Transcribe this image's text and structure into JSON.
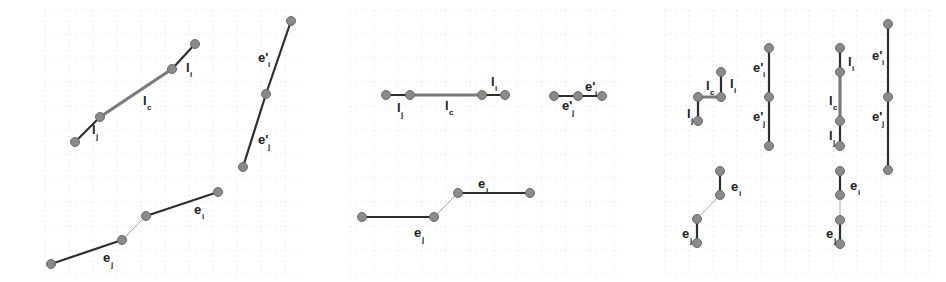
{
  "colors": {
    "edge": "#2e2e2e",
    "common_edge": "#7a7a7a",
    "connector": "#a8a8a8",
    "node_fill": "#8a8a8a",
    "node_stroke": "#6a6a6a",
    "grid": "#ececec"
  },
  "panels": [
    {
      "id": "panel-1-top-left",
      "nodes": [
        [
          75,
          142
        ],
        [
          100,
          117
        ],
        [
          172,
          69
        ],
        [
          195,
          44
        ]
      ],
      "edges": [
        {
          "from": 0,
          "to": 1,
          "kind": "edge"
        },
        {
          "from": 1,
          "to": 2,
          "kind": "common"
        },
        {
          "from": 2,
          "to": 3,
          "kind": "edge"
        }
      ],
      "labels": [
        {
          "base": "l",
          "sub": "j",
          "prime": false,
          "x": 92,
          "y": 134
        },
        {
          "base": "l",
          "sub": "c",
          "prime": false,
          "x": 143,
          "y": 105
        },
        {
          "base": "l",
          "sub": "i",
          "prime": false,
          "x": 186,
          "y": 72
        }
      ]
    },
    {
      "id": "panel-1-top-right",
      "nodes": [
        [
          291,
          21
        ],
        [
          266,
          94
        ],
        [
          243,
          167
        ]
      ],
      "edges": [
        {
          "from": 0,
          "to": 1,
          "kind": "edge"
        },
        {
          "from": 1,
          "to": 2,
          "kind": "edge"
        }
      ],
      "labels": [
        {
          "base": "e",
          "sub": "i",
          "prime": true,
          "x": 258,
          "y": 62
        },
        {
          "base": "e",
          "sub": "j",
          "prime": true,
          "x": 258,
          "y": 144
        }
      ]
    },
    {
      "id": "panel-1-bottom",
      "nodes": [
        [
          51,
          264
        ],
        [
          122,
          240
        ],
        [
          146,
          216
        ],
        [
          218,
          192
        ]
      ],
      "edges": [
        {
          "from": 0,
          "to": 1,
          "kind": "edge"
        },
        {
          "from": 1,
          "to": 2,
          "kind": "connector"
        },
        {
          "from": 2,
          "to": 3,
          "kind": "edge"
        }
      ],
      "labels": [
        {
          "base": "e",
          "sub": "j",
          "prime": false,
          "x": 103,
          "y": 262
        },
        {
          "base": "e",
          "sub": "i",
          "prime": false,
          "x": 194,
          "y": 214
        }
      ]
    },
    {
      "id": "panel-2-top-left",
      "nodes": [
        [
          386,
          95
        ],
        [
          410,
          95
        ],
        [
          482,
          95
        ],
        [
          505,
          95
        ]
      ],
      "edges": [
        {
          "from": 0,
          "to": 1,
          "kind": "edge"
        },
        {
          "from": 1,
          "to": 2,
          "kind": "common"
        },
        {
          "from": 2,
          "to": 3,
          "kind": "edge"
        }
      ],
      "labels": [
        {
          "base": "l",
          "sub": "j",
          "prime": false,
          "x": 397,
          "y": 112
        },
        {
          "base": "l",
          "sub": "c",
          "prime": false,
          "x": 445,
          "y": 110
        },
        {
          "base": "l",
          "sub": "i",
          "prime": false,
          "x": 491,
          "y": 86
        }
      ]
    },
    {
      "id": "panel-2-top-right",
      "nodes": [
        [
          554,
          96
        ],
        [
          578,
          96
        ],
        [
          602,
          96
        ]
      ],
      "edges": [
        {
          "from": 0,
          "to": 1,
          "kind": "edge"
        },
        {
          "from": 1,
          "to": 2,
          "kind": "edge"
        }
      ],
      "labels": [
        {
          "base": "e",
          "sub": "j",
          "prime": true,
          "x": 562,
          "y": 110
        },
        {
          "base": "e",
          "sub": "i",
          "prime": true,
          "x": 585,
          "y": 91
        }
      ]
    },
    {
      "id": "panel-2-bottom",
      "nodes": [
        [
          362,
          217
        ],
        [
          434,
          217
        ],
        [
          458,
          193
        ],
        [
          530,
          193
        ]
      ],
      "edges": [
        {
          "from": 0,
          "to": 1,
          "kind": "edge"
        },
        {
          "from": 1,
          "to": 2,
          "kind": "connector"
        },
        {
          "from": 2,
          "to": 3,
          "kind": "edge"
        }
      ],
      "labels": [
        {
          "base": "e",
          "sub": "j",
          "prime": false,
          "x": 414,
          "y": 237
        },
        {
          "base": "e",
          "sub": "i",
          "prime": false,
          "x": 478,
          "y": 188
        }
      ]
    },
    {
      "id": "panel-3-top-left",
      "nodes": [
        [
          698,
          121
        ],
        [
          698,
          97
        ],
        [
          721,
          97
        ],
        [
          721,
          72
        ]
      ],
      "edges": [
        {
          "from": 0,
          "to": 1,
          "kind": "edge"
        },
        {
          "from": 1,
          "to": 2,
          "kind": "common"
        },
        {
          "from": 2,
          "to": 3,
          "kind": "edge"
        }
      ],
      "labels": [
        {
          "base": "l",
          "sub": "j",
          "prime": false,
          "x": 687,
          "y": 118
        },
        {
          "base": "l",
          "sub": "c",
          "prime": false,
          "x": 706,
          "y": 90
        },
        {
          "base": "l",
          "sub": "i",
          "prime": false,
          "x": 730,
          "y": 88
        }
      ]
    },
    {
      "id": "panel-3-top-right",
      "nodes": [
        [
          769,
          48
        ],
        [
          769,
          97
        ],
        [
          769,
          146
        ]
      ],
      "edges": [
        {
          "from": 0,
          "to": 1,
          "kind": "edge"
        },
        {
          "from": 1,
          "to": 2,
          "kind": "edge"
        }
      ],
      "labels": [
        {
          "base": "e",
          "sub": "i",
          "prime": true,
          "x": 753,
          "y": 72
        },
        {
          "base": "e",
          "sub": "j",
          "prime": true,
          "x": 753,
          "y": 121
        }
      ]
    },
    {
      "id": "panel-3-bottom",
      "nodes": [
        [
          720,
          171
        ],
        [
          720,
          195
        ],
        [
          697,
          219
        ],
        [
          697,
          243
        ]
      ],
      "edges": [
        {
          "from": 0,
          "to": 1,
          "kind": "edge"
        },
        {
          "from": 1,
          "to": 2,
          "kind": "connector"
        },
        {
          "from": 2,
          "to": 3,
          "kind": "edge"
        }
      ],
      "labels": [
        {
          "base": "e",
          "sub": "i",
          "prime": false,
          "x": 731,
          "y": 191
        },
        {
          "base": "e",
          "sub": "j",
          "prime": false,
          "x": 682,
          "y": 238
        }
      ]
    },
    {
      "id": "panel-4-top-left",
      "nodes": [
        [
          840,
          48
        ],
        [
          840,
          72
        ],
        [
          840,
          121
        ],
        [
          840,
          146
        ]
      ],
      "edges": [
        {
          "from": 0,
          "to": 1,
          "kind": "edge"
        },
        {
          "from": 1,
          "to": 2,
          "kind": "common"
        },
        {
          "from": 2,
          "to": 3,
          "kind": "edge"
        }
      ],
      "labels": [
        {
          "base": "l",
          "sub": "i",
          "prime": false,
          "x": 848,
          "y": 66
        },
        {
          "base": "l",
          "sub": "c",
          "prime": false,
          "x": 829,
          "y": 105
        },
        {
          "base": "l",
          "sub": "j",
          "prime": false,
          "x": 829,
          "y": 140
        }
      ]
    },
    {
      "id": "panel-4-top-right",
      "nodes": [
        [
          888,
          24
        ],
        [
          888,
          97
        ],
        [
          888,
          170
        ]
      ],
      "edges": [
        {
          "from": 0,
          "to": 1,
          "kind": "edge"
        },
        {
          "from": 1,
          "to": 2,
          "kind": "edge"
        }
      ],
      "labels": [
        {
          "base": "e",
          "sub": "i",
          "prime": true,
          "x": 872,
          "y": 60
        },
        {
          "base": "e",
          "sub": "j",
          "prime": true,
          "x": 872,
          "y": 121
        }
      ]
    },
    {
      "id": "panel-4-bottom",
      "nodes": [
        [
          840,
          171
        ],
        [
          840,
          195
        ],
        [
          840,
          220
        ],
        [
          840,
          244
        ]
      ],
      "edges": [
        {
          "from": 0,
          "to": 1,
          "kind": "edge"
        },
        {
          "from": 1,
          "to": 2,
          "kind": "connector"
        },
        {
          "from": 2,
          "to": 3,
          "kind": "edge"
        }
      ],
      "labels": [
        {
          "base": "e",
          "sub": "i",
          "prime": false,
          "x": 850,
          "y": 190
        },
        {
          "base": "e",
          "sub": "j",
          "prime": false,
          "x": 826,
          "y": 238
        }
      ]
    }
  ],
  "grid_regions": [
    {
      "x": 45,
      "y": 10,
      "w": 260,
      "h": 265
    },
    {
      "x": 350,
      "y": 10,
      "w": 275,
      "h": 265
    },
    {
      "x": 665,
      "y": 10,
      "w": 270,
      "h": 265
    }
  ]
}
